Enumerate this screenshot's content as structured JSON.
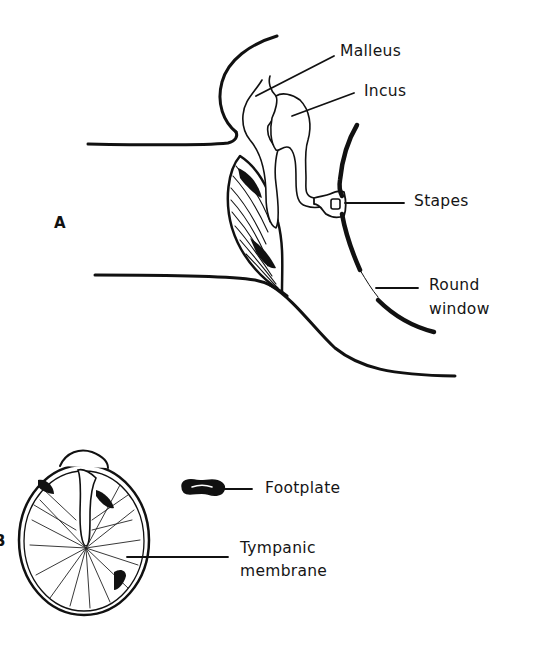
{
  "figure": {
    "colors": {
      "ink": "#111111",
      "background": "#ffffff"
    },
    "panel_a": {
      "letter": "A",
      "labels": {
        "malleus": "Malleus",
        "incus": "Incus",
        "stapes": "Stapes",
        "round_window_line1": "Round",
        "round_window_line2": "window"
      }
    },
    "panel_b": {
      "letter": "B",
      "labels": {
        "footplate": "Footplate",
        "tympanic_line1": "Tympanic",
        "tympanic_line2": "membrane"
      }
    }
  }
}
